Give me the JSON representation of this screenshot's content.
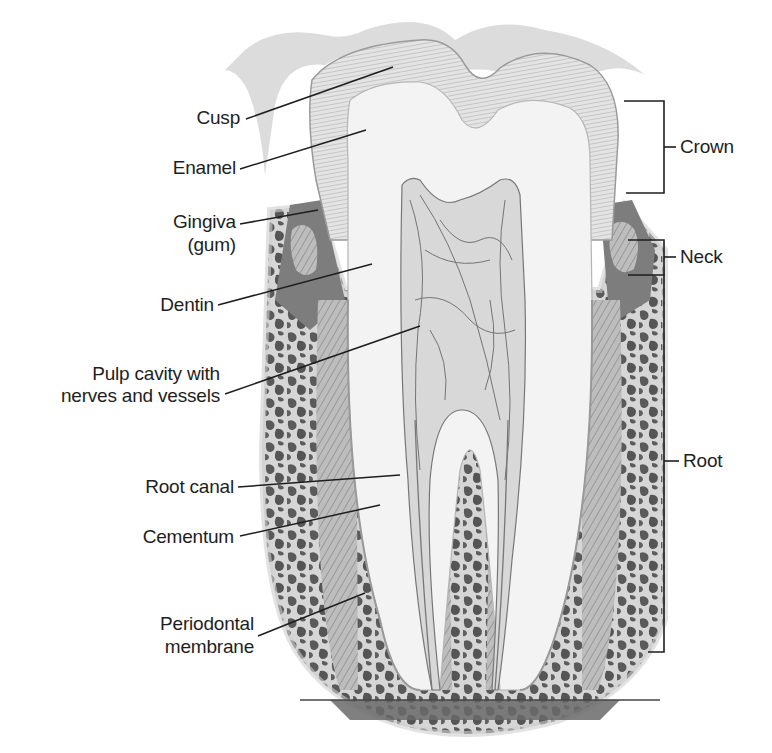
{
  "diagram": {
    "left_labels": [
      {
        "id": "cusp",
        "text": "Cusp"
      },
      {
        "id": "enamel",
        "text": "Enamel"
      },
      {
        "id": "gingiva",
        "line1": "Gingiva",
        "line2": "(gum)"
      },
      {
        "id": "dentin",
        "text": "Dentin"
      },
      {
        "id": "pulp",
        "line1": "Pulp cavity with",
        "line2": "nerves and vessels"
      },
      {
        "id": "root-canal",
        "text": "Root canal"
      },
      {
        "id": "cementum",
        "text": "Cementum"
      },
      {
        "id": "periodontal",
        "line1": "Periodontal",
        "line2": "membrane"
      }
    ],
    "right_labels": [
      {
        "id": "crown",
        "text": "Crown"
      },
      {
        "id": "neck",
        "text": "Neck"
      },
      {
        "id": "root",
        "text": "Root"
      }
    ],
    "colors": {
      "enamel": "#dcdcdc",
      "dentin": "#f2f2f2",
      "pulp": "#d9d9d9",
      "bone": "#5a5a5a",
      "gum": "#8a8a8a",
      "line": "#1e1e1e"
    }
  }
}
